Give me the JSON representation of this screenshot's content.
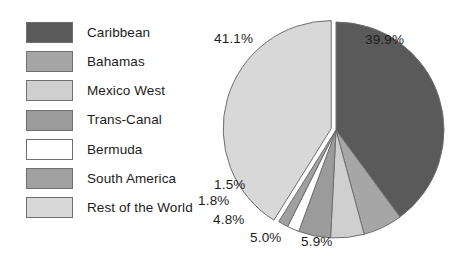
{
  "chart_data": {
    "type": "pie",
    "title": "",
    "legend_position": "left",
    "categories": [
      "Caribbean",
      "Bahamas",
      "Mexico West",
      "Trans-Canal",
      "Bermuda",
      "South America",
      "Rest of the World"
    ],
    "values": [
      39.9,
      5.9,
      5.0,
      4.8,
      1.8,
      1.5,
      41.1
    ],
    "value_labels": [
      "39.9%",
      "5.9%",
      "5.0%",
      "4.8%",
      "1.8%",
      "1.5%",
      "41.1%"
    ],
    "unit": "%",
    "colors": [
      "#5a5a5a",
      "#a6a6a6",
      "#cfcfcf",
      "#9b9b9b",
      "#ffffff",
      "#a0a0a0",
      "#d8d8d8"
    ],
    "slice_border_color": "#6f6f6f",
    "background": "#ffffff"
  },
  "legend": {
    "items": [
      {
        "label": "Caribbean",
        "color": "#5a5a5a"
      },
      {
        "label": "Bahamas",
        "color": "#a6a6a6"
      },
      {
        "label": "Mexico West",
        "color": "#cfcfcf"
      },
      {
        "label": "Trans-Canal",
        "color": "#9b9b9b"
      },
      {
        "label": "Bermuda",
        "color": "#ffffff"
      },
      {
        "label": "South America",
        "color": "#a0a0a0"
      },
      {
        "label": "Rest of the World",
        "color": "#d8d8d8"
      }
    ]
  },
  "labels": {
    "caribbean_pct": "39.9%",
    "bahamas_pct": "5.9%",
    "mexico_west_pct": "5.0%",
    "trans_canal_pct": "4.8%",
    "bermuda_pct": "1.8%",
    "south_america_pct": "1.5%",
    "rest_of_world_pct": "41.1%"
  }
}
